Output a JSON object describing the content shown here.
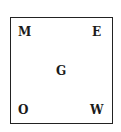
{
  "diagram": {
    "letters": {
      "top_left": "M",
      "top_right": "E",
      "center": "G",
      "bottom_left": "O",
      "bottom_right": "W"
    },
    "border_color": "#222222",
    "text_color": "#1a1a1a"
  }
}
